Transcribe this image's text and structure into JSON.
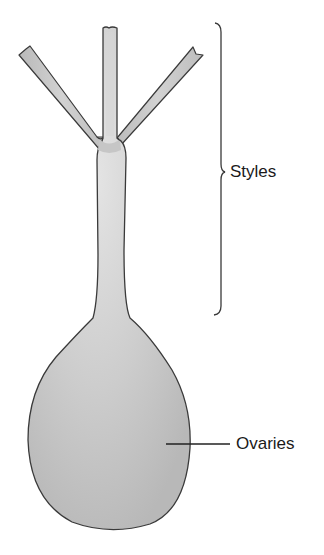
{
  "diagram": {
    "labels": [
      {
        "id": "styles",
        "text": "Styles",
        "pointer": "bracket"
      },
      {
        "id": "ovaries",
        "text": "Ovaries",
        "pointer": "leader-line"
      }
    ],
    "colors": {
      "fill": "#c4c4c4",
      "fill_highlight": "#e2e2e2",
      "outline": "#3a3a3a",
      "text": "#1a1a1a",
      "background": "#ffffff"
    }
  }
}
